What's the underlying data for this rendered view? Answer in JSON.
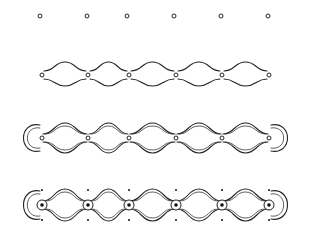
{
  "diagram": {
    "type": "pattern-construction-steps",
    "background": "#ffffff",
    "ink": "#222222",
    "steps": [
      {
        "id": 1,
        "name": "dot-grid",
        "y": 16,
        "points_x": [
          40,
          87,
          127,
          174,
          221,
          268
        ]
      },
      {
        "id": 2,
        "name": "single-wave-chain",
        "y": 75,
        "points_x": [
          42,
          88,
          129,
          176,
          222,
          269
        ]
      },
      {
        "id": 3,
        "name": "double-wave-chain-with-loops",
        "y": 138,
        "points_x": [
          42,
          88,
          129,
          176,
          222,
          269
        ]
      },
      {
        "id": 4,
        "name": "double-wave-chain-with-rings-and-dots",
        "y": 205,
        "points_x": [
          42,
          88,
          129,
          176,
          222,
          269
        ]
      }
    ]
  }
}
